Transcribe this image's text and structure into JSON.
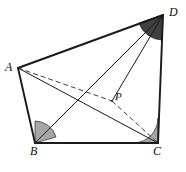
{
  "figure": {
    "kind": "geometry-diagram",
    "width": 186,
    "height": 172,
    "background": "#ffffff",
    "stroke_color": "#1a1a1a",
    "dash_color": "#4d4d4d",
    "angle_fill_light": "#a6a6a6",
    "angle_fill_dark": "#404040",
    "labels": {
      "a": "A",
      "b": "B",
      "c": "C",
      "d": "D",
      "p": "P"
    },
    "points": {
      "A": {
        "x": 18,
        "y": 68
      },
      "B": {
        "x": 35,
        "y": 143
      },
      "C": {
        "x": 158,
        "y": 143
      },
      "D": {
        "x": 163,
        "y": 15
      },
      "P": {
        "x": 112,
        "y": 101
      }
    },
    "edges": [
      {
        "name": "edge-AD",
        "from": "A",
        "to": "D",
        "style": "solid",
        "weight": "thick"
      },
      {
        "name": "edge-AB",
        "from": "A",
        "to": "B",
        "style": "solid",
        "weight": "thick"
      },
      {
        "name": "edge-BC",
        "from": "B",
        "to": "C",
        "style": "solid",
        "weight": "thick"
      },
      {
        "name": "edge-CD",
        "from": "C",
        "to": "D",
        "style": "solid",
        "weight": "thick"
      },
      {
        "name": "diagonal-AC",
        "from": "A",
        "to": "C",
        "style": "solid",
        "weight": "thin"
      },
      {
        "name": "diagonal-BD",
        "from": "B",
        "to": "D",
        "style": "solid",
        "weight": "thin"
      },
      {
        "name": "segment-DP",
        "from": "D",
        "to": "P",
        "style": "solid",
        "weight": "thin"
      },
      {
        "name": "segment-AP",
        "from": "A",
        "to": "P",
        "style": "dashed",
        "weight": "thin"
      },
      {
        "name": "segment-PC",
        "from": "P",
        "to": "C",
        "style": "dashed",
        "weight": "thin"
      }
    ],
    "angle_marks": [
      {
        "name": "angle-mark-B",
        "vertex": "B",
        "fill": "light"
      },
      {
        "name": "angle-mark-C",
        "vertex": "C",
        "fill": "light"
      },
      {
        "name": "angle-mark-D",
        "vertex": "D",
        "fill": "dark"
      }
    ]
  }
}
